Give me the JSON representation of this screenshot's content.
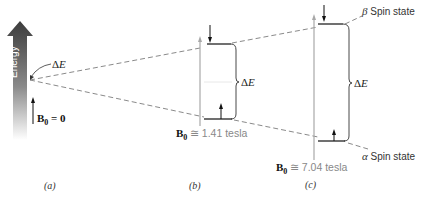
{
  "figure": {
    "axis_label": "Energy",
    "panels": [
      {
        "id": "a",
        "caption": "(a)",
        "field_symbol": "B",
        "field_subscript": "0",
        "field_relation": "= 0"
      },
      {
        "id": "b",
        "caption": "(b)",
        "field_symbol": "B",
        "field_subscript": "0",
        "field_relation": "≅",
        "field_value": "1.41 tesla",
        "gap_label_symbol": "Δ",
        "gap_label_var": "E"
      },
      {
        "id": "c",
        "caption": "(c)",
        "field_symbol": "B",
        "field_subscript": "0",
        "field_relation": "≅",
        "field_value": "7.04 tesla",
        "gap_label_symbol": "Δ",
        "gap_label_var": "E"
      }
    ],
    "origin_gap_label_symbol": "Δ",
    "origin_gap_label_var": "E",
    "states": {
      "upper": {
        "greek": "β",
        "label": "Spin state"
      },
      "lower": {
        "greek": "α",
        "label": "Spin state"
      }
    },
    "colors": {
      "arrow_dark": "#4a4a4a",
      "dashed_line": "#8a8a8a",
      "field_line": "#a8a8a8",
      "level_line": "#222222"
    }
  }
}
